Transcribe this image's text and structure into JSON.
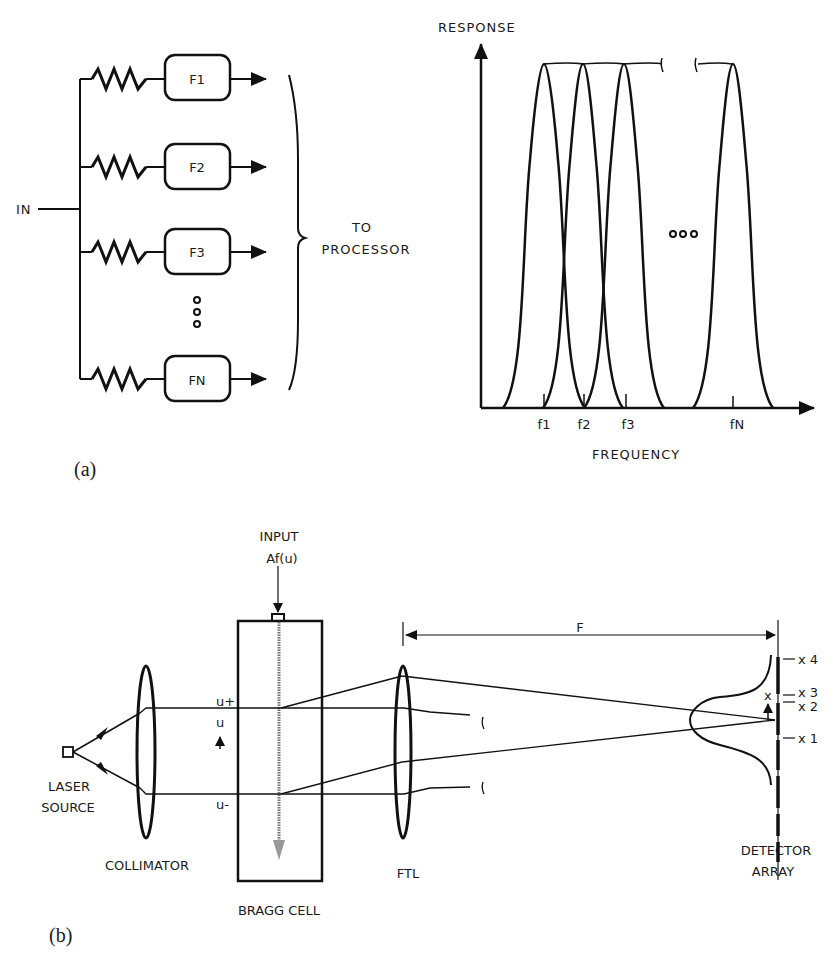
{
  "figure_a": {
    "caption": "(a)",
    "filter_bank": {
      "input_label": "IN",
      "filters": [
        {
          "label": "F1"
        },
        {
          "label": "F2"
        },
        {
          "label": "F3"
        },
        {
          "label": "FN"
        }
      ],
      "ellipsis": "vertical-dots",
      "output_label_line1": "TO",
      "output_label_line2": "PROCESSOR"
    },
    "response_plot": {
      "y_axis_label": "RESPONSE",
      "x_axis_label": "FREQUENCY",
      "ticks": [
        "f1",
        "f2",
        "f3",
        "fN"
      ],
      "ellipsis": "horizontal-dots"
    }
  },
  "figure_b": {
    "caption": "(b)",
    "input_label_line1": "INPUT",
    "input_label_line2": "Af(u)",
    "laser_label_line1": "LASER",
    "laser_label_line2": "SOURCE",
    "collimator_label": "COLLIMATOR",
    "bragg_cell_label": "BRAGG CELL",
    "ftl_label": "FTL",
    "focal_length_label": "F",
    "detector_label_line1": "DETECTOR",
    "detector_label_line2": "ARRAY",
    "u_plus": "u+",
    "u_axis": "u",
    "u_minus": "u-",
    "x_axis": "x",
    "detector_elements": [
      "x 4",
      "x 3",
      "x 2",
      "x 1"
    ]
  }
}
